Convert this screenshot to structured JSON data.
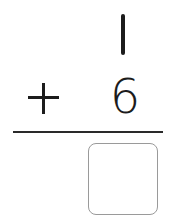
{
  "problem": {
    "top_number": "1",
    "operator": "+",
    "bottom_number": "6",
    "answer": ""
  },
  "colors": {
    "ink": "#1c1c1c",
    "box_border": "#9a9a9a",
    "background": "#ffffff"
  }
}
